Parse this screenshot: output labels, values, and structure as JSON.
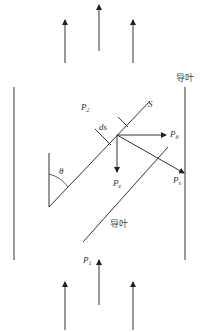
{
  "diagram": {
    "title": "",
    "labels": {
      "guide_vane_right": "导叶",
      "guide_vane_lower": "导叶",
      "streamline": "S",
      "element": "ds",
      "angle": "θ",
      "p_outlet": "P",
      "p_outlet_sub": "2",
      "p_inlet": "P",
      "p_inlet_sub": "1",
      "p_theta": "P",
      "p_theta_sub": "θ",
      "p_z": "P",
      "p_z_sub": "z",
      "p_s": "P",
      "p_s_sub": "s"
    },
    "flow_direction": "upward",
    "colors": {
      "line": "#333333",
      "wall": "#555555",
      "text": "#333333"
    }
  }
}
